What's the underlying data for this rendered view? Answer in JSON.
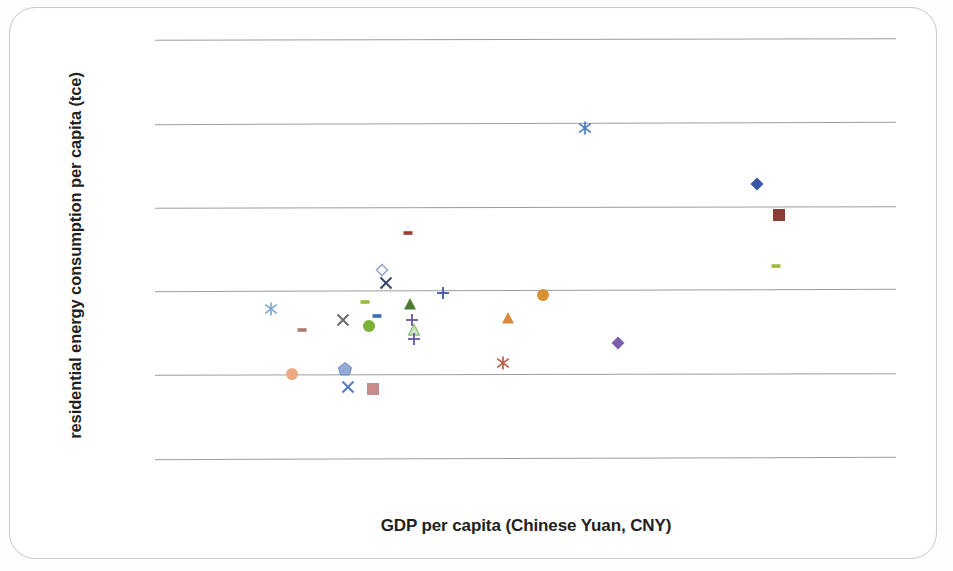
{
  "chart_data": {
    "type": "scatter",
    "title": "",
    "xlabel": "GDP per capita (Chinese Yuan, CNY)",
    "ylabel": "residential energy consumption per capita (tce)",
    "grid": true,
    "gridlines_horizontal": 6,
    "legend": "none",
    "axis_tick_labels": "none",
    "note": "Scanned scatter plot; axes are unlabeled with no numeric ticks. Values below are normalized positions read off the plot area, where x=0 is the left end of the gridlines and x=1 the right end, y=0 the bottom gridline and y=1 the top gridline.",
    "xlim": [
      0,
      1
    ],
    "ylim": [
      0,
      1
    ],
    "points": [
      {
        "label": "point-1",
        "marker": "asterisk",
        "color": "#4a7ebb",
        "x": 0.58,
        "y": 0.787
      },
      {
        "label": "point-2",
        "marker": "diamond",
        "color": "#3a57a4",
        "x": 0.813,
        "y": 0.655
      },
      {
        "label": "point-3",
        "marker": "square",
        "color": "#8b3c35",
        "x": 0.842,
        "y": 0.579
      },
      {
        "label": "point-4",
        "marker": "dash",
        "color": "#9bbb3c",
        "x": 0.838,
        "y": 0.459
      },
      {
        "label": "point-5",
        "marker": "dash",
        "color": "#a03d32",
        "x": 0.341,
        "y": 0.536
      },
      {
        "label": "point-6",
        "marker": "diamond-outline",
        "color": "#9aa7cf",
        "x": 0.306,
        "y": 0.448
      },
      {
        "label": "point-7",
        "marker": "cross-x",
        "color": "#3b4a6b",
        "x": 0.312,
        "y": 0.418
      },
      {
        "label": "point-8",
        "marker": "plus",
        "color": "#4a5fa8",
        "x": 0.389,
        "y": 0.394
      },
      {
        "label": "point-9",
        "marker": "asterisk",
        "color": "#79a9d4",
        "x": 0.156,
        "y": 0.355
      },
      {
        "label": "point-10",
        "marker": "dash",
        "color": "#9bbb3c",
        "x": 0.283,
        "y": 0.372
      },
      {
        "label": "point-11",
        "marker": "dash",
        "color": "#3a6fb5",
        "x": 0.3,
        "y": 0.34
      },
      {
        "label": "point-12",
        "marker": "cross-x",
        "color": "#6f6f7a",
        "x": 0.254,
        "y": 0.33
      },
      {
        "label": "point-13",
        "marker": "triangle",
        "color": "#4f7a34",
        "x": 0.344,
        "y": 0.368
      },
      {
        "label": "point-14",
        "marker": "plus",
        "color": "#6a5fa8",
        "x": 0.347,
        "y": 0.33
      },
      {
        "label": "point-15",
        "marker": "circle",
        "color": "#7db135",
        "x": 0.289,
        "y": 0.316
      },
      {
        "label": "point-16",
        "marker": "dash",
        "color": "#b07a6e",
        "x": 0.199,
        "y": 0.305
      },
      {
        "label": "point-17",
        "marker": "triangle-outline",
        "color": "#93bf7a",
        "x": 0.35,
        "y": 0.305
      },
      {
        "label": "point-18",
        "marker": "plus",
        "color": "#6a5fa8",
        "x": 0.35,
        "y": 0.283
      },
      {
        "label": "point-19",
        "marker": "triangle",
        "color": "#d98a3c",
        "x": 0.477,
        "y": 0.333
      },
      {
        "label": "point-20",
        "marker": "circle",
        "color": "#d9902f",
        "x": 0.524,
        "y": 0.388
      },
      {
        "label": "point-21",
        "marker": "diamond",
        "color": "#7b5ea8",
        "x": 0.625,
        "y": 0.274
      },
      {
        "label": "point-22",
        "marker": "asterisk",
        "color": "#bf5a4a",
        "x": 0.469,
        "y": 0.227
      },
      {
        "label": "point-23",
        "marker": "circle",
        "color": "#f0a882",
        "x": 0.185,
        "y": 0.201
      },
      {
        "label": "point-24",
        "marker": "pentagon",
        "color": "#6f8fc4",
        "x": 0.257,
        "y": 0.212
      },
      {
        "label": "point-25",
        "marker": "cross-x",
        "color": "#5b7fc0",
        "x": 0.261,
        "y": 0.17
      },
      {
        "label": "point-26",
        "marker": "square",
        "color": "#c98a8a",
        "x": 0.294,
        "y": 0.164
      }
    ]
  },
  "axis": {
    "y_title": "residential energy consumption per capita (tce)",
    "x_title": "GDP per capita (Chinese Yuan, CNY)"
  }
}
